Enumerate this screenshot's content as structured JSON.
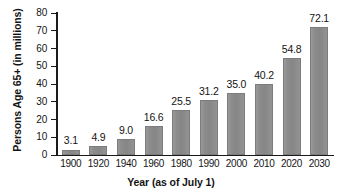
{
  "chart_data": {
    "type": "bar",
    "title": "",
    "xlabel": "Year (as of July 1)",
    "ylabel": "Persons Age 65+ (in millions)",
    "categories": [
      "1900",
      "1920",
      "1940",
      "1960",
      "1980",
      "1990",
      "2000",
      "2010",
      "2020",
      "2030"
    ],
    "values": [
      3.1,
      4.9,
      9.0,
      16.6,
      25.5,
      31.2,
      35.0,
      40.2,
      54.8,
      72.1
    ],
    "value_labels": [
      "3.1",
      "4.9",
      "9.0",
      "16.6",
      "25.5",
      "31.2",
      "35.0",
      "40.2",
      "54.8",
      "72.1"
    ],
    "ylim": [
      0,
      80
    ],
    "ytick_labels": [
      "0",
      "10",
      "20",
      "30",
      "40",
      "50",
      "60",
      "70",
      "80"
    ],
    "ytick_values": [
      0,
      10,
      20,
      30,
      40,
      50,
      60,
      70,
      80
    ],
    "grid": false,
    "legend": false,
    "bar_color": "#8d8d8d",
    "axis_color": "#1a1a1a",
    "background_color": "#ffffff"
  }
}
